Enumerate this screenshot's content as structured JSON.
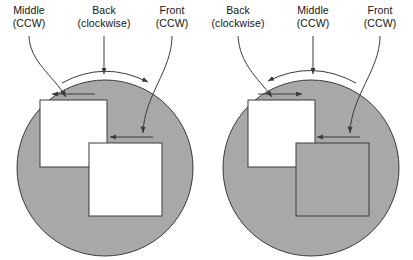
{
  "figure": {
    "title": "",
    "colors": {
      "circle_fill": "#a8a8a8",
      "square_fill_white": "#ffffff",
      "square_fill_gray": "#a8a8a8",
      "stroke": "#3a3a3a",
      "text": "#141414",
      "background": "#ffffff"
    },
    "diagrams": [
      {
        "id": "left-diagram",
        "labels": [
          {
            "id": "middle",
            "line1": "Middle",
            "line2": "(CCW)"
          },
          {
            "id": "back",
            "line1": "Back",
            "line2": "(clockwise)"
          },
          {
            "id": "front",
            "line1": "Front",
            "line2": "(CCW)"
          }
        ],
        "rotation_arc": {
          "direction": "clockwise",
          "points": "right"
        },
        "shapes": [
          {
            "id": "back-circle",
            "kind": "circle",
            "fill": "gray",
            "spin": "clockwise"
          },
          {
            "id": "middle-square",
            "kind": "square",
            "fill": "white",
            "spin": "ccw",
            "arrow": "left"
          },
          {
            "id": "front-square",
            "kind": "square",
            "fill": "white",
            "spin": "ccw",
            "arrow": "left"
          }
        ]
      },
      {
        "id": "right-diagram",
        "labels": [
          {
            "id": "back",
            "line1": "Back",
            "line2": "(clockwise)"
          },
          {
            "id": "middle",
            "line1": "Middle",
            "line2": "(CCW)"
          },
          {
            "id": "front",
            "line1": "Front",
            "line2": "(CCW)"
          }
        ],
        "rotation_arc": {
          "direction": "counterclockwise",
          "points": "left"
        },
        "shapes": [
          {
            "id": "back-circle",
            "kind": "circle",
            "fill": "gray",
            "spin": "clockwise"
          },
          {
            "id": "middle-square",
            "kind": "square",
            "fill": "white",
            "spin": "ccw",
            "arrow": "right"
          },
          {
            "id": "front-square",
            "kind": "square",
            "fill": "gray",
            "spin": "ccw",
            "arrow": "left"
          }
        ]
      }
    ]
  }
}
